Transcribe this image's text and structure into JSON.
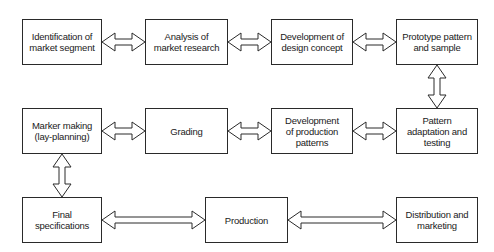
{
  "diagram": {
    "type": "flowchart",
    "title": "",
    "nodes": [
      {
        "id": "n1",
        "label": "Identification of market segment"
      },
      {
        "id": "n2",
        "label": "Analysis of market research"
      },
      {
        "id": "n3",
        "label": "Development of design concept"
      },
      {
        "id": "n4",
        "label": "Prototype pattern and sample"
      },
      {
        "id": "n5",
        "label": "Marker making (lay-planning)"
      },
      {
        "id": "n6",
        "label": "Grading"
      },
      {
        "id": "n7",
        "label": "Development of production patterns"
      },
      {
        "id": "n8",
        "label": "Pattern adaptation and testing"
      },
      {
        "id": "n9",
        "label": "Final specifications"
      },
      {
        "id": "n10",
        "label": "Production"
      },
      {
        "id": "n11",
        "label": "Distribution and marketing"
      }
    ],
    "edges": [
      {
        "from": "n1",
        "to": "n2",
        "style": "double-headed-hollow-arrow"
      },
      {
        "from": "n2",
        "to": "n3",
        "style": "double-headed-hollow-arrow"
      },
      {
        "from": "n3",
        "to": "n4",
        "style": "double-headed-hollow-arrow"
      },
      {
        "from": "n4",
        "to": "n8",
        "style": "double-headed-hollow-arrow"
      },
      {
        "from": "n8",
        "to": "n7",
        "style": "double-headed-hollow-arrow"
      },
      {
        "from": "n7",
        "to": "n6",
        "style": "double-headed-hollow-arrow"
      },
      {
        "from": "n6",
        "to": "n5",
        "style": "double-headed-hollow-arrow"
      },
      {
        "from": "n5",
        "to": "n9",
        "style": "double-headed-hollow-arrow"
      },
      {
        "from": "n9",
        "to": "n10",
        "style": "double-headed-hollow-arrow"
      },
      {
        "from": "n10",
        "to": "n11",
        "style": "double-headed-hollow-arrow"
      }
    ]
  },
  "labels": {
    "n1": [
      "Identification of",
      "market segment"
    ],
    "n2": [
      "Analysis of",
      "market research"
    ],
    "n3": [
      "Development of",
      "design concept"
    ],
    "n4": [
      "Prototype pattern",
      "and sample"
    ],
    "n5": [
      "Marker making",
      "(lay-planning)"
    ],
    "n6": [
      "Grading"
    ],
    "n7": [
      "Development",
      "of production",
      "patterns"
    ],
    "n8": [
      "Pattern",
      "adaptation and",
      "testing"
    ],
    "n9": [
      "Final",
      "specifications"
    ],
    "n10": [
      "Production"
    ],
    "n11": [
      "Distribution and",
      "marketing"
    ]
  },
  "colors": {
    "stroke": "#2a2a2a",
    "fill": "#ffffff",
    "text": "#1a1a1a"
  }
}
